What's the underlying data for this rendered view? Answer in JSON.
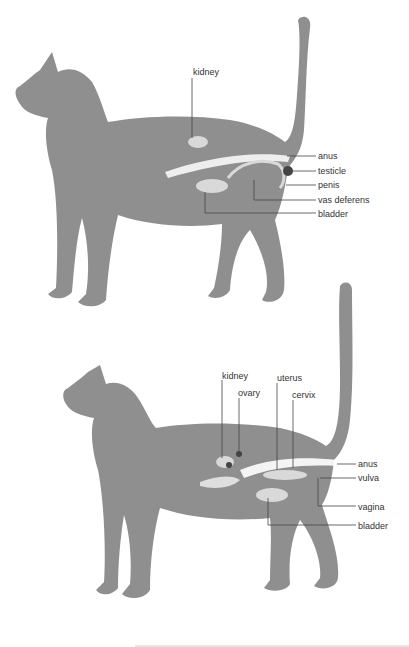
{
  "colors": {
    "silhouette": "#8f8f8f",
    "organ": "#d9d9d9",
    "highlight": "#ffffff",
    "leader": "#444444",
    "text": "#333333"
  },
  "male_diagram": {
    "labels": {
      "kidney": "kidney",
      "anus": "anus",
      "testicle": "testicle",
      "penis": "penis",
      "vas_deferens": "vas deferens",
      "bladder": "bladder"
    }
  },
  "female_diagram": {
    "labels": {
      "kidney": "kidney",
      "ovary": "ovary",
      "uterus": "uterus",
      "cervix": "cervix",
      "anus": "anus",
      "vulva": "vulva",
      "vagina": "vagina",
      "bladder": "bladder"
    }
  }
}
